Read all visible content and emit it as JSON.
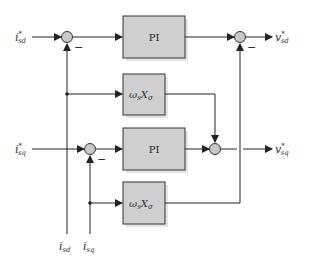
{
  "diagram": {
    "type": "control-block-diagram",
    "inputs": {
      "isd_ref": {
        "base": "i",
        "sup": "*",
        "sub": "sd"
      },
      "isq_ref": {
        "base": "i",
        "sup": "*",
        "sub": "sq"
      },
      "isd_fb": {
        "base": "i",
        "sub": "sd"
      },
      "isq_fb": {
        "base": "i",
        "sub": "sq"
      }
    },
    "outputs": {
      "vsd_ref": {
        "base": "v",
        "sup": "*",
        "sub": "sd"
      },
      "vsq_ref": {
        "base": "v",
        "sup": "*",
        "sub": "sq"
      }
    },
    "blocks": [
      {
        "id": "pi-d",
        "label": "PI"
      },
      {
        "id": "decouple-d",
        "label_base": "ω",
        "label_sub": "s",
        "label_base2": "X",
        "label_sub2": "σ"
      },
      {
        "id": "pi-q",
        "label": "PI"
      },
      {
        "id": "decouple-q",
        "label_base": "ω",
        "label_sub": "s",
        "label_base2": "X",
        "label_sub2": "σ"
      }
    ],
    "signs": {
      "minus": "−"
    },
    "colors": {
      "block_fill": "#cfcfcf",
      "block_shadow": "#e2e2e2",
      "line": "#222222",
      "junction_fill": "#c8c8c8"
    }
  }
}
